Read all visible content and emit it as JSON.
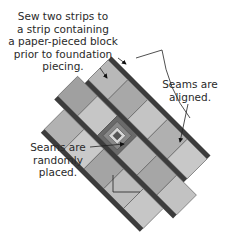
{
  "diagram": {
    "labels": {
      "top_note": {
        "lines": [
          "Sew two strips to",
          "a strip containing",
          "a paper-pieced block",
          "prior to foundation",
          "piecing."
        ]
      },
      "aligned_note": {
        "lines": [
          "Seams are",
          "aligned."
        ]
      },
      "random_note": {
        "lines": [
          "Seams are",
          "randomly",
          "placed."
        ]
      }
    },
    "colors": {
      "strip_border": "#3c3c3c",
      "square_light": "#c8c8c8",
      "square_mid": "#b0b0b0",
      "square_dark": "#9a9a9a",
      "block_dark": "#555555",
      "line": "#222222",
      "text": "#2a2a2a"
    }
  }
}
